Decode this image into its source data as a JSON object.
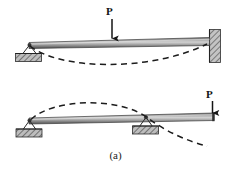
{
  "figure": {
    "caption": "(a)",
    "subfigures": [
      {
        "id": "top",
        "description": "propped cantilever beam with central point load",
        "load_label": "P",
        "load_x": 112,
        "supports": [
          "pin-roller-hatched-left",
          "fixed-wall-right"
        ],
        "deflection": "downward-sagging-dashed-curve"
      },
      {
        "id": "bottom",
        "description": "overhanging beam on two supports with end point load",
        "load_label": "P",
        "load_x": 212,
        "supports": [
          "pin-roller-hatched-left",
          "pin-roller-hatched-middle"
        ],
        "deflection": "upward-hogging-dashed-curve-with-downward-tip"
      }
    ]
  },
  "colors": {
    "background": "#ffffff",
    "beam_dark": "#4a4a4a",
    "beam_mid": "#8d8d8d",
    "beam_light": "#c9c9c9",
    "ink": "#141414",
    "dashed": "#1c1c1c",
    "support_fill": "#b5b5b5",
    "support_edge": "#2b2b2b"
  },
  "load_labels": {
    "top": "P",
    "bottom": "P"
  }
}
